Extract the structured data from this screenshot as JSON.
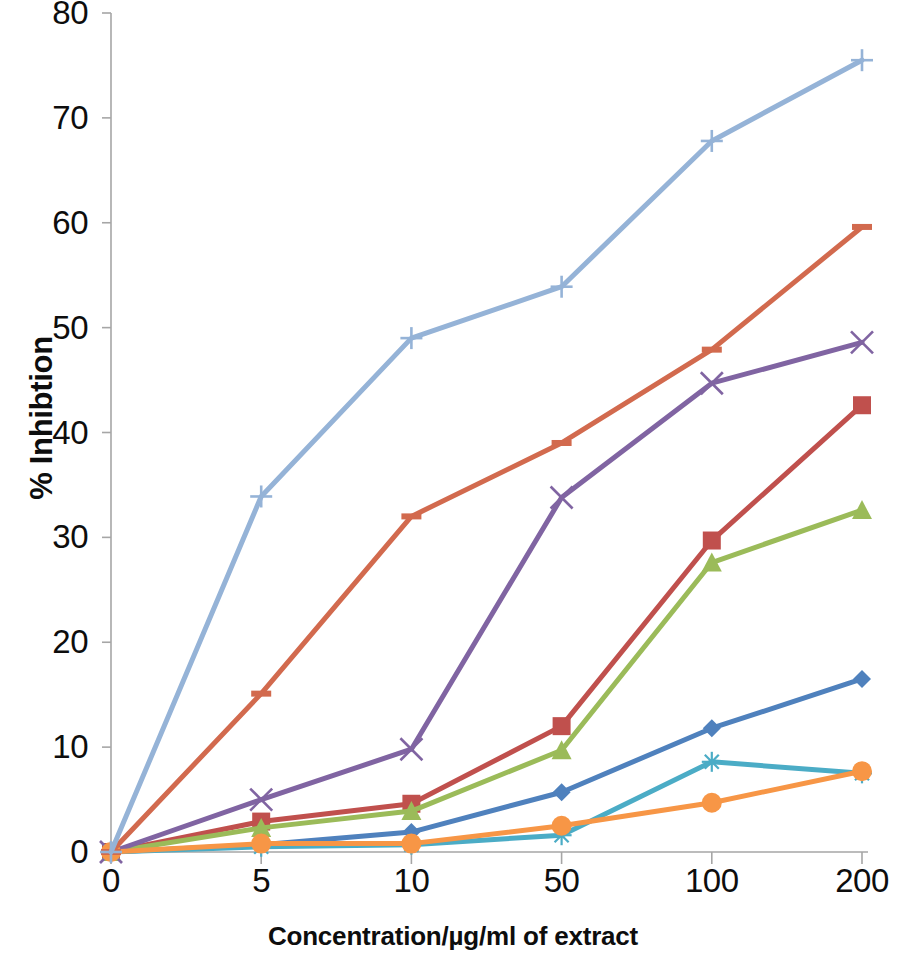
{
  "chart_data": {
    "type": "line",
    "title": "",
    "xlabel": "Concentration/µg/ml of extract",
    "ylabel": "% Inhibtion",
    "categories": [
      "0",
      "5",
      "10",
      "50",
      "100",
      "200"
    ],
    "x_tick_labels": [
      "0",
      "5",
      "10",
      "50",
      "100",
      "200"
    ],
    "y_tick_labels": [
      "0",
      "10",
      "20",
      "30",
      "40",
      "50",
      "60",
      "70",
      "80"
    ],
    "ylim": [
      0,
      80
    ],
    "y_tick_step": 10,
    "grid": false,
    "legend": "none",
    "x_scale": "categorical",
    "series": [
      {
        "name": "Series 1",
        "color": "#4F81BD",
        "marker": "diamond",
        "values": [
          0,
          0.7,
          1.9,
          5.7,
          11.8,
          16.5
        ]
      },
      {
        "name": "Series 2",
        "color": "#C0504D",
        "marker": "square",
        "values": [
          0,
          2.9,
          4.6,
          12.0,
          29.7,
          42.6
        ]
      },
      {
        "name": "Series 3",
        "color": "#9BBB59",
        "marker": "triangle",
        "values": [
          0,
          2.3,
          3.9,
          9.7,
          27.6,
          32.6
        ]
      },
      {
        "name": "Series 4",
        "color": "#8064A2",
        "marker": "cross-x",
        "values": [
          0,
          5.0,
          9.8,
          33.8,
          44.7,
          48.6
        ]
      },
      {
        "name": "Series 5",
        "color": "#4BACC6",
        "marker": "asterisk",
        "values": [
          0,
          0.5,
          0.7,
          1.6,
          8.6,
          7.5
        ]
      },
      {
        "name": "Series 6",
        "color": "#F79646",
        "marker": "circle",
        "values": [
          0,
          0.8,
          0.8,
          2.5,
          4.7,
          7.7
        ]
      },
      {
        "name": "Series 7",
        "color": "#D26A4E",
        "marker": "dash",
        "values": [
          0,
          15.1,
          32.0,
          39.0,
          47.9,
          59.6
        ]
      },
      {
        "name": "Series 8",
        "color": "#95B3D7",
        "marker": "plus",
        "values": [
          0,
          33.9,
          49.0,
          53.9,
          67.8,
          75.5
        ]
      }
    ]
  }
}
